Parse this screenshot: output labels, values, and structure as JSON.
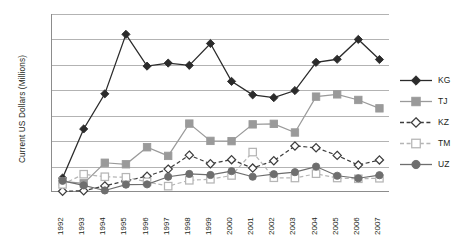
{
  "chart": {
    "type": "line",
    "ylabel": "Current US Dollars (Millions)",
    "xlabel": "",
    "title": ""
  },
  "axes": {
    "y_ticks": [
      "70.0",
      "60.0",
      "50.0",
      "40.0",
      "30.0",
      "20.0",
      "10.0",
      "0.0"
    ],
    "x_ticks": [
      "1992",
      "1993",
      "1994",
      "1995",
      "1996",
      "1997",
      "1998",
      "1999",
      "2000",
      "2001",
      "2002",
      "2003",
      "2004",
      "2005",
      "2006",
      "2007"
    ]
  },
  "legend": {
    "items": [
      {
        "label": "KG",
        "marker": "filled-diamond-icon",
        "color": "#2b2b2b",
        "dash": "solid"
      },
      {
        "label": "TJ",
        "marker": "filled-square-icon",
        "color": "#9a9a9a",
        "dash": "solid"
      },
      {
        "label": "KZ",
        "marker": "open-diamond-icon",
        "color": "#3d3d3d",
        "dash": "dashed"
      },
      {
        "label": "TM",
        "marker": "open-square-icon",
        "color": "#b5b5b5",
        "dash": "dashed"
      },
      {
        "label": "UZ",
        "marker": "filled-circle-icon",
        "color": "#6e6e6e",
        "dash": "solid"
      }
    ]
  },
  "chart_data": {
    "type": "line",
    "title": "",
    "xlabel": "",
    "ylabel": "Current US Dollars (Millions)",
    "categories": [
      "1992",
      "1993",
      "1994",
      "1995",
      "1996",
      "1997",
      "1998",
      "1999",
      "2000",
      "2001",
      "2002",
      "2003",
      "2004",
      "2005",
      "2006",
      "2007"
    ],
    "ylim": [
      0,
      70
    ],
    "ytick_step": 10,
    "grid": true,
    "legend_position": "right",
    "series": [
      {
        "name": "KG",
        "color": "#2b2b2b",
        "marker": "filled-diamond",
        "dash": "solid",
        "values": [
          5.5,
          24.8,
          38.6,
          62.0,
          49.5,
          50.7,
          49.8,
          58.4,
          43.5,
          38.2,
          37.1,
          39.9,
          51.0,
          52.2,
          60.0,
          52.1
        ]
      },
      {
        "name": "TJ",
        "color": "#9a9a9a",
        "marker": "filled-square",
        "dash": "solid",
        "values": [
          4.2,
          3.4,
          11.5,
          10.9,
          17.6,
          14.2,
          26.9,
          20.1,
          20.0,
          26.6,
          26.8,
          23.4,
          37.5,
          38.4,
          36.2,
          32.9
        ]
      },
      {
        "name": "KZ",
        "color": "#3d3d3d",
        "marker": "open-diamond",
        "dash": "dashed",
        "values": [
          0.3,
          0.5,
          2.4,
          4.4,
          6.2,
          9.0,
          14.5,
          11.1,
          12.7,
          9.4,
          12.3,
          18.1,
          17.4,
          14.4,
          10.6,
          12.6
        ]
      },
      {
        "name": "TM",
        "color": "#b5b5b5",
        "marker": "open-square",
        "dash": "dashed",
        "values": [
          3.0,
          7.0,
          6.0,
          5.8,
          4.0,
          2.3,
          4.6,
          5.0,
          6.5,
          15.7,
          5.6,
          5.5,
          7.2,
          5.5,
          5.2,
          5.4
        ]
      },
      {
        "name": "UZ",
        "color": "#6e6e6e",
        "marker": "filled-circle",
        "dash": "solid",
        "values": [
          4.4,
          2.6,
          0.6,
          2.9,
          3.0,
          6.0,
          7.1,
          6.7,
          8.2,
          6.0,
          7.0,
          7.8,
          10.0,
          6.4,
          5.4,
          6.6
        ]
      }
    ]
  }
}
